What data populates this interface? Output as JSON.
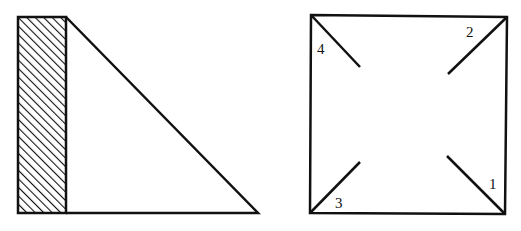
{
  "colors": {
    "stroke": "#111111",
    "background": "#ffffff",
    "hatch": "#111111"
  },
  "left_figure": {
    "description": "Hatched vertical rectangle (wall) with right triangle attached",
    "wall": {
      "x": 18,
      "y": 17,
      "width": 48,
      "height": 196
    },
    "triangle": {
      "apex": [
        66,
        17
      ],
      "base_left": [
        66,
        213
      ],
      "base_right": [
        258,
        213
      ]
    }
  },
  "right_figure": {
    "description": "Square with four numbered diagonal segments from the corners toward the center",
    "square": {
      "tl": [
        311,
        15
      ],
      "tr": [
        507,
        17
      ],
      "br": [
        505,
        214
      ],
      "bl": [
        310,
        213
      ]
    },
    "segments": [
      {
        "label": "1",
        "from": [
          505,
          214
        ],
        "to": [
          447,
          156
        ],
        "label_pos": [
          489,
          189
        ]
      },
      {
        "label": "2",
        "from": [
          507,
          17
        ],
        "to": [
          448,
          74
        ],
        "label_pos": [
          466,
          37
        ]
      },
      {
        "label": "3",
        "from": [
          310,
          213
        ],
        "to": [
          360,
          162
        ],
        "label_pos": [
          335,
          208
        ]
      },
      {
        "label": "4",
        "from": [
          311,
          15
        ],
        "to": [
          360,
          67
        ],
        "label_pos": [
          317,
          54
        ]
      }
    ]
  }
}
